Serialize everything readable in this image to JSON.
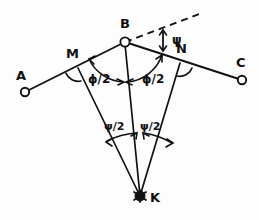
{
  "figure": {
    "background_color": "#fdfdfd",
    "ink_color": "#111111",
    "points": [
      {
        "id": "A",
        "label": "A",
        "x": 25,
        "y": 92,
        "label_x": 16,
        "label_y": 80,
        "marker": "open-circle"
      },
      {
        "id": "B",
        "label": "B",
        "x": 125,
        "y": 42,
        "label_x": 120,
        "label_y": 28,
        "marker": "open-circle"
      },
      {
        "id": "C",
        "label": "C",
        "x": 242,
        "y": 80,
        "label_x": 236,
        "label_y": 67,
        "marker": "open-circle"
      },
      {
        "id": "M",
        "label": "M",
        "x": 78,
        "y": 68,
        "label_x": 66,
        "label_y": 58,
        "marker": "none"
      },
      {
        "id": "N",
        "label": "N",
        "x": 180,
        "y": 63,
        "label_x": 176,
        "label_y": 53,
        "marker": "none"
      },
      {
        "id": "K",
        "label": "K",
        "x": 140,
        "y": 196,
        "label_x": 150,
        "label_y": 202,
        "marker": "filled-star"
      }
    ],
    "angle_labels": [
      {
        "id": "psi-top",
        "text": "ψ",
        "x": 172,
        "y": 44,
        "size": "normal"
      },
      {
        "id": "phi-half-left",
        "text": "ϕ/2",
        "x": 88,
        "y": 83,
        "size": "normal"
      },
      {
        "id": "phi-half-right",
        "text": "ϕ/2",
        "x": 142,
        "y": 83,
        "size": "normal"
      },
      {
        "id": "psi-half-left",
        "text": "ψ/2",
        "x": 104,
        "y": 130,
        "size": "small"
      },
      {
        "id": "psi-half-right",
        "text": "ψ/2",
        "x": 140,
        "y": 130,
        "size": "small"
      }
    ],
    "segments": [
      {
        "id": "A-to-B",
        "from": "A",
        "to": "B",
        "style": "solid"
      },
      {
        "id": "B-to-C",
        "from": "B",
        "to": "C",
        "style": "solid"
      },
      {
        "id": "M-to-K",
        "from": "M",
        "to": "K",
        "style": "solid"
      },
      {
        "id": "B-to-K",
        "from": "B",
        "to": "K",
        "style": "solid"
      },
      {
        "id": "N-to-K",
        "from": "N",
        "to": "K",
        "style": "solid"
      },
      {
        "id": "B-extension",
        "from": "B",
        "to": "dashed-end",
        "style": "dashed"
      }
    ]
  }
}
